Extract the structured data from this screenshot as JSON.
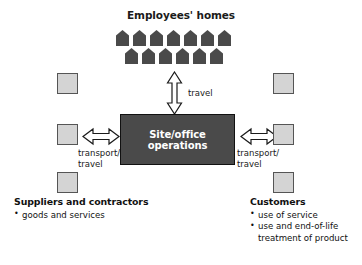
{
  "diagram": {
    "title": "Employees' homes",
    "center": {
      "label": "Site/office operations"
    },
    "houses": {
      "icon_name": "house-icon",
      "top_row_count": 7,
      "bottom_row_count": 6
    },
    "arrows": [
      {
        "id": "vertical",
        "icon_name": "double-arrow-vertical-icon",
        "label": "travel",
        "connects": "Employees' homes <-> Site/office operations"
      },
      {
        "id": "left",
        "icon_name": "double-arrow-horizontal-icon",
        "label": "transport/\ntravel",
        "connects": "Suppliers and contractors <-> Site/office operations"
      },
      {
        "id": "right",
        "icon_name": "double-arrow-horizontal-icon",
        "label": "transport/\ntravel",
        "connects": "Site/office operations <-> Customers"
      }
    ],
    "squares": {
      "icon_name": "gray-square-icon",
      "left_count": 3,
      "right_count": 3
    },
    "captions": {
      "suppliers": {
        "heading": "Suppliers and contractors",
        "items": [
          "goods and services"
        ]
      },
      "customers": {
        "heading": "Customers",
        "items": [
          "use of service",
          "use and end-of-life treatment of product"
        ]
      }
    },
    "colors": {
      "dark_fill": "#4a4a4a",
      "square_fill": "#d4d4d4",
      "square_border": "#555555",
      "text": "#111111",
      "center_text": "#ffffff",
      "background": "#ffffff"
    }
  }
}
